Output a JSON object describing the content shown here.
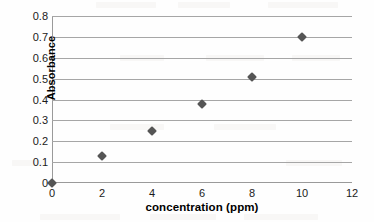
{
  "chart_data": {
    "type": "scatter",
    "title": "",
    "xlabel": "concentration (ppm)",
    "ylabel": "Absorbance",
    "xlim": [
      0,
      12
    ],
    "ylim": [
      0,
      0.8
    ],
    "xticks": [
      "0",
      "2",
      "4",
      "6",
      "8",
      "10",
      "12"
    ],
    "xtick_values": [
      0,
      2,
      4,
      6,
      8,
      10,
      12
    ],
    "yticks": [
      "0",
      "0.1",
      "0.2",
      "0.3",
      "0.4",
      "0.5",
      "0.6",
      "0.7",
      "0.8"
    ],
    "ytick_values": [
      0,
      0.1,
      0.2,
      0.3,
      0.4,
      0.5,
      0.6,
      0.7,
      0.8
    ],
    "grid": "horizontal",
    "legend": "none",
    "marker": "diamond",
    "marker_color": "#555555",
    "gridline_color": "#a6a6a6",
    "background_color": "#ffffff",
    "x": [
      0,
      2,
      4,
      6,
      8,
      10
    ],
    "values": [
      0.0,
      0.13,
      0.25,
      0.38,
      0.51,
      0.7
    ],
    "points": [
      {
        "x": 0,
        "y": 0.0
      },
      {
        "x": 2,
        "y": 0.13
      },
      {
        "x": 4,
        "y": 0.25
      },
      {
        "x": 6,
        "y": 0.38
      },
      {
        "x": 8,
        "y": 0.51
      },
      {
        "x": 10,
        "y": 0.7
      }
    ]
  }
}
